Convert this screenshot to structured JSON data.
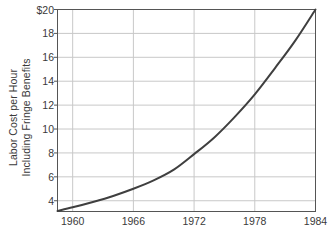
{
  "chart_data": {
    "type": "line",
    "title": "",
    "subtitle": "",
    "xlabel": "",
    "ylabel": "Labor Cost per Hour Including Fringe Benefits",
    "ylabel_lines": [
      "Labor Cost per Hour",
      "Including Fringe Benefits"
    ],
    "xlim": [
      1958.5,
      1984
    ],
    "ylim": [
      3.1,
      20
    ],
    "xticks": [
      1960,
      1966,
      1972,
      1978,
      1984
    ],
    "xticklabels": [
      "1960",
      "1966",
      "1972",
      "1978",
      "1984"
    ],
    "yticks": [
      4,
      6,
      8,
      10,
      12,
      14,
      16,
      18,
      20
    ],
    "yticklabels": [
      "4",
      "6",
      "8",
      "10",
      "12",
      "14",
      "16",
      "18",
      "$20"
    ],
    "grid": true,
    "grid_color": "#c8c8c8",
    "frame_color": "#555555",
    "line_color": "#3f3f3f",
    "line_width": 2.0,
    "legend": null,
    "series": [
      {
        "name": "Labor cost per hour including fringe benefits",
        "x": [
          1958.5,
          1960,
          1962,
          1964,
          1966,
          1968,
          1970,
          1972,
          1974,
          1976,
          1978,
          1980,
          1982,
          1984
        ],
        "values": [
          3.15,
          3.45,
          3.9,
          4.4,
          5.0,
          5.7,
          6.6,
          7.9,
          9.3,
          11.0,
          12.9,
          15.1,
          17.4,
          20.0
        ]
      }
    ]
  },
  "axis_titles": {
    "y_line1": "Labor Cost per Hour",
    "y_line2": "Including Fringe Benefits"
  }
}
